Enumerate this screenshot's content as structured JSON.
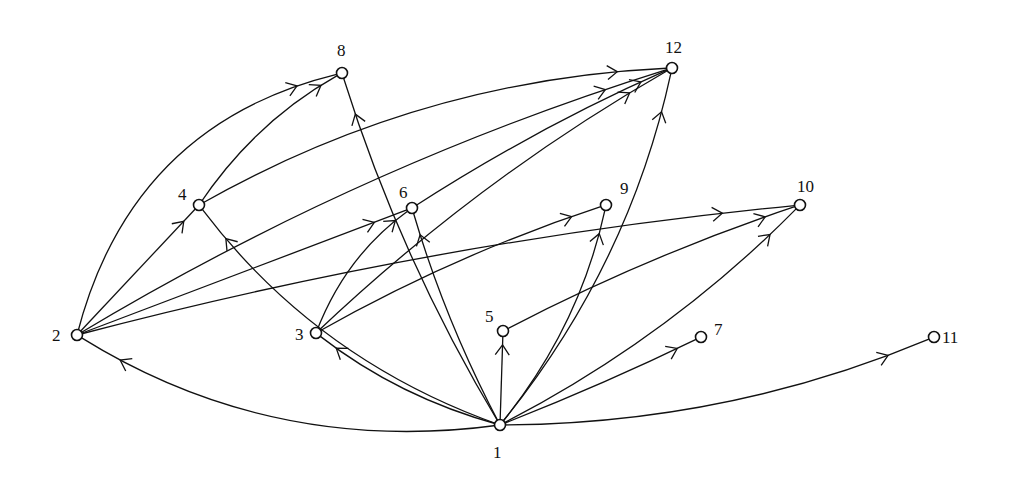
{
  "diagram": {
    "type": "directed-graph",
    "nodes": [
      {
        "id": "1",
        "label": "1",
        "x": 500,
        "y": 425,
        "lx": 493,
        "ly": 458
      },
      {
        "id": "2",
        "label": "2",
        "x": 77,
        "y": 335,
        "lx": 52,
        "ly": 341
      },
      {
        "id": "3",
        "label": "3",
        "x": 316,
        "y": 333,
        "lx": 295,
        "ly": 340
      },
      {
        "id": "4",
        "label": "4",
        "x": 199,
        "y": 205,
        "lx": 178,
        "ly": 200
      },
      {
        "id": "5",
        "label": "5",
        "x": 503,
        "y": 331,
        "lx": 485,
        "ly": 322
      },
      {
        "id": "6",
        "label": "6",
        "x": 412,
        "y": 208,
        "lx": 399,
        "ly": 198
      },
      {
        "id": "7",
        "label": "7",
        "x": 701,
        "y": 337,
        "lx": 714,
        "ly": 335
      },
      {
        "id": "8",
        "label": "8",
        "x": 342,
        "y": 73,
        "lx": 337,
        "ly": 56
      },
      {
        "id": "9",
        "label": "9",
        "x": 606,
        "y": 205,
        "lx": 620,
        "ly": 194
      },
      {
        "id": "10",
        "label": "10",
        "x": 800,
        "y": 205,
        "lx": 797,
        "ly": 192
      },
      {
        "id": "11",
        "label": "11",
        "x": 934,
        "y": 337,
        "lx": 942,
        "ly": 343
      },
      {
        "id": "12",
        "label": "12",
        "x": 672,
        "y": 68,
        "lx": 665,
        "ly": 53
      }
    ],
    "edges": [
      {
        "from": "1",
        "to": "2",
        "bend": -0.18
      },
      {
        "from": "1",
        "to": "3",
        "bend": -0.1
      },
      {
        "from": "1",
        "to": "4",
        "bend": -0.15
      },
      {
        "from": "1",
        "to": "5",
        "bend": 0
      },
      {
        "from": "1",
        "to": "6",
        "bend": -0.05
      },
      {
        "from": "1",
        "to": "7",
        "bend": 0.02
      },
      {
        "from": "1",
        "to": "8",
        "bend": -0.06
      },
      {
        "from": "1",
        "to": "9",
        "bend": 0.12
      },
      {
        "from": "1",
        "to": "10",
        "bend": 0.08
      },
      {
        "from": "1",
        "to": "11",
        "bend": 0.1
      },
      {
        "from": "1",
        "to": "12",
        "bend": 0.12
      },
      {
        "from": "2",
        "to": "8",
        "bend": -0.3
      },
      {
        "from": "2",
        "to": "4",
        "bend": 0
      },
      {
        "from": "2",
        "to": "6",
        "bend": 0
      },
      {
        "from": "2",
        "to": "12",
        "bend": -0.06
      },
      {
        "from": "2",
        "to": "10",
        "bend": -0.04
      },
      {
        "from": "4",
        "to": "8",
        "bend": -0.12
      },
      {
        "from": "4",
        "to": "12",
        "bend": -0.12
      },
      {
        "from": "3",
        "to": "6",
        "bend": -0.15
      },
      {
        "from": "3",
        "to": "9",
        "bend": -0.05
      },
      {
        "from": "3",
        "to": "12",
        "bend": -0.06
      },
      {
        "from": "6",
        "to": "12",
        "bend": -0.04
      },
      {
        "from": "5",
        "to": "10",
        "bend": -0.04
      }
    ],
    "colors": {
      "stroke": "#111111",
      "background": "#ffffff"
    }
  }
}
